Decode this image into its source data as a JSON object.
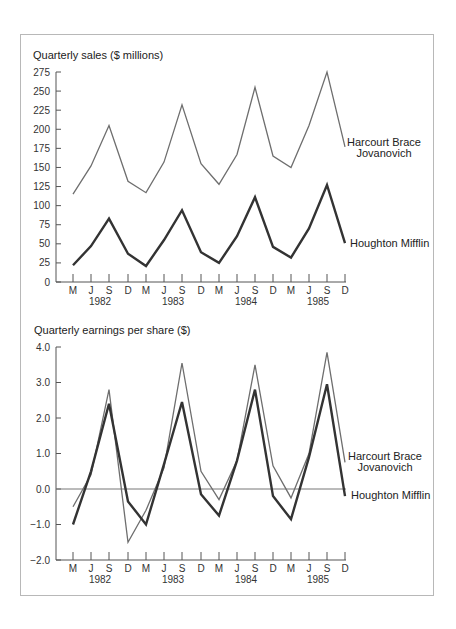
{
  "chart_data": [
    {
      "type": "line",
      "title": "Quarterly sales ($ millions)",
      "xlabel": "",
      "ylabel": "",
      "ylim": [
        0,
        275
      ],
      "yticks": [
        0,
        25,
        50,
        75,
        100,
        125,
        150,
        175,
        200,
        225,
        250,
        275
      ],
      "x": [
        "M",
        "J",
        "S",
        "D",
        "M",
        "J",
        "S",
        "D",
        "M",
        "J",
        "S",
        "D",
        "M",
        "J",
        "S",
        "D"
      ],
      "year_labels": [
        "1982",
        "1983",
        "1984",
        "1985"
      ],
      "grid": false,
      "legend_position": "right, inline at line ends",
      "series": [
        {
          "name": "Harcourt Brace Jovanovich",
          "values": [
            115,
            152,
            205,
            132,
            117,
            157,
            232,
            155,
            128,
            167,
            255,
            165,
            150,
            205,
            275,
            177
          ]
        },
        {
          "name": "Houghton Mifflin",
          "values": [
            22,
            47,
            83,
            37,
            21,
            55,
            94,
            39,
            25,
            60,
            111,
            46,
            32,
            70,
            127,
            51
          ]
        }
      ]
    },
    {
      "type": "line",
      "title": "Quarterly earnings per share ($)",
      "xlabel": "",
      "ylabel": "",
      "ylim": [
        -2.0,
        4.0
      ],
      "yticks": [
        -2.0,
        -1.0,
        0.0,
        1.0,
        2.0,
        3.0,
        4.0
      ],
      "x": [
        "M",
        "J",
        "S",
        "D",
        "M",
        "J",
        "S",
        "D",
        "M",
        "J",
        "S",
        "D",
        "M",
        "J",
        "S",
        "D"
      ],
      "year_labels": [
        "1982",
        "1983",
        "1984",
        "1985"
      ],
      "grid": false,
      "zero_line": true,
      "legend_position": "right, inline at line ends",
      "series": [
        {
          "name": "Harcourt Brace Jovanovich",
          "values": [
            -0.5,
            0.4,
            2.8,
            -1.5,
            -0.6,
            0.6,
            3.55,
            0.5,
            -0.3,
            0.8,
            3.5,
            0.65,
            -0.25,
            1.0,
            3.85,
            0.75
          ]
        },
        {
          "name": "Houghton Mifflin",
          "values": [
            -1.0,
            0.5,
            2.4,
            -0.35,
            -1.0,
            0.7,
            2.45,
            -0.15,
            -0.75,
            0.8,
            2.8,
            -0.2,
            -0.85,
            0.9,
            2.95,
            -0.2
          ]
        }
      ]
    }
  ],
  "charts": {
    "sales": {
      "title": "Quarterly sales ($ millions)",
      "ytick_labels": [
        "0",
        "25",
        "50",
        "75",
        "100",
        "125",
        "150",
        "175",
        "200",
        "225",
        "250",
        "275"
      ],
      "legend": {
        "hbj_line1": "Harcourt Brace",
        "hbj_line2": "Jovanovich",
        "hm": "Houghton Mifflin"
      }
    },
    "eps": {
      "title": "Quarterly earnings per share ($)",
      "ytick_labels": [
        "−2.0",
        "−1.0",
        "0.0",
        "1.0",
        "2.0",
        "3.0",
        "4.0"
      ],
      "legend": {
        "hbj_line1": "Harcourt Brace",
        "hbj_line2": "Jovanovich",
        "hm": "Houghton Mifflin"
      }
    }
  },
  "colors": {
    "hbj": "#6e6e6e",
    "hm": "#333333",
    "frame": "#b8b8b8"
  }
}
